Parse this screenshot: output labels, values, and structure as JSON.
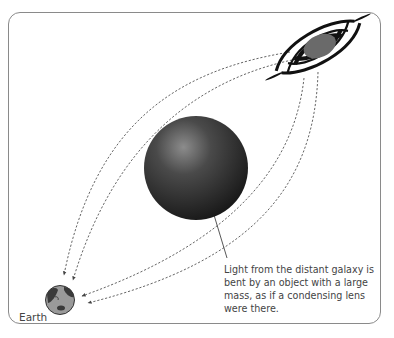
{
  "diagram": {
    "labels": {
      "earth": "Earth",
      "caption": "Light from the distant galaxy is bent by an object with a large mass, as if a condensing lens were there."
    },
    "elements": {
      "source": "spiral-galaxy",
      "lens": "massive-object-sphere",
      "observer": "earth-globe"
    },
    "colors": {
      "frame": "#8a8a8a",
      "light_path": "#555555",
      "sphere_dark": "#1e1e1e",
      "sphere_light": "#8a8a8a",
      "galaxy_arms": "#111111",
      "galaxy_core": "#6a6a6a",
      "earth_ocean": "#9a9a9a",
      "earth_land": "#3a3a3a",
      "text": "#444444"
    }
  }
}
